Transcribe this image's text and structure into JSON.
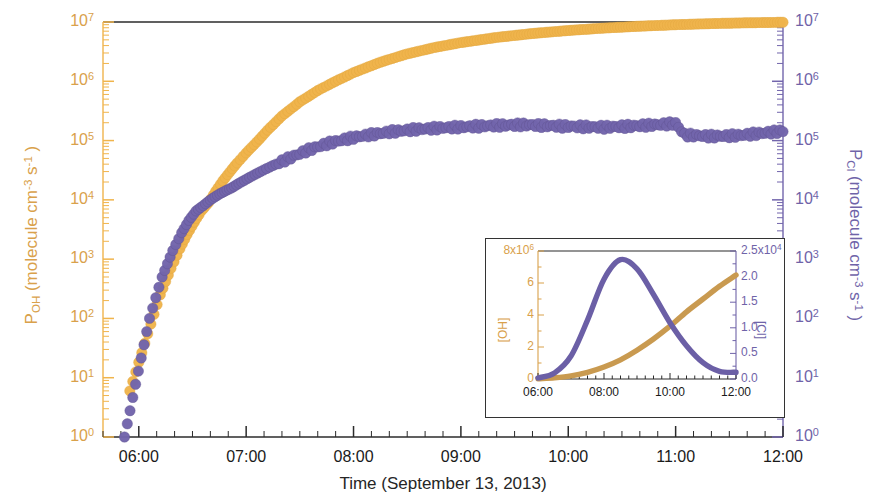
{
  "figure": {
    "xaxis": {
      "title": "Time (September 13, 2013)",
      "ticks": [
        "06:00",
        "07:00",
        "08:00",
        "09:00",
        "10:00",
        "11:00",
        "12:00"
      ]
    },
    "yaxis_left": {
      "title_main": "P",
      "title_sub": "OH",
      "title_rest": " (molecule cm",
      "title_sup1": "-3",
      "title_mid": " s",
      "title_sup2": "-1",
      "title_end": " )",
      "color": "#D9A14B",
      "ticks": [
        "10",
        "10",
        "10",
        "10",
        "10",
        "10",
        "10",
        "10"
      ],
      "exponents": [
        "7",
        "6",
        "5",
        "4",
        "3",
        "2",
        "1",
        "0"
      ]
    },
    "yaxis_right": {
      "title_main": "P",
      "title_sub": "Cl",
      "title_rest": " (molecule cm",
      "title_sup1": "-3",
      "title_mid": " s",
      "title_sup2": "-1",
      "title_end": " )",
      "color": "#6F63A8",
      "ticks": [
        "10",
        "10",
        "10",
        "10",
        "10",
        "10",
        "10",
        "10"
      ],
      "exponents": [
        "7",
        "6",
        "5",
        "4",
        "3",
        "2",
        "1",
        "0"
      ]
    },
    "inset": {
      "yaxis_left": {
        "label": "[OH]",
        "color": "#D9A14B",
        "top_tick": "8x10",
        "top_exp": "6",
        "ticks": [
          "6",
          "4",
          "2",
          "0"
        ]
      },
      "yaxis_right": {
        "label": "[Cl]",
        "color": "#6F63A8",
        "top_tick": "2.5x10",
        "top_exp": "4",
        "ticks": [
          "2.0",
          "1.5",
          "1.0",
          "0.5",
          "0.0"
        ]
      },
      "xticks": [
        "06:00",
        "08:00",
        "10:00",
        "12:00"
      ]
    }
  },
  "chart_data": {
    "type": "scatter",
    "title": "",
    "xlabel": "Time (September 13, 2013)",
    "ylabel": "P_OH (molecule cm^-3 s^-1)",
    "ylabel_right": "P_Cl (molecule cm^-3 s^-1)",
    "xlim": [
      "05:40",
      "12:00"
    ],
    "x_tick_labels": [
      "06:00",
      "07:00",
      "08:00",
      "09:00",
      "10:00",
      "11:00",
      "12:00"
    ],
    "yscale": "log",
    "ylim": [
      1,
      10000000
    ],
    "ylim_right": [
      1,
      10000000
    ],
    "grid": false,
    "legend": "none",
    "series": [
      {
        "name": "P_OH",
        "color": "#F0B44C",
        "marker": "circle",
        "axis": "left",
        "x": [
          "05:55",
          "06:05",
          "06:12",
          "06:18",
          "06:23",
          "06:27",
          "06:31",
          "06:35",
          "06:39",
          "06:43",
          "06:47",
          "06:51",
          "06:55",
          "07:00",
          "07:06",
          "07:12",
          "07:20",
          "07:30",
          "07:40",
          "07:50",
          "08:00",
          "08:15",
          "08:30",
          "08:45",
          "09:00",
          "09:20",
          "09:40",
          "10:00",
          "10:20",
          "10:40",
          "11:00",
          "11:20",
          "11:40",
          "12:00"
        ],
        "y": [
          6.0,
          55,
          250,
          700,
          1500,
          2600,
          4200,
          6500,
          9000,
          14000,
          21000,
          30000,
          42000,
          62000,
          95000,
          150000,
          260000,
          450000,
          700000,
          1000000,
          1400000,
          2100000,
          2900000,
          3700000,
          4500000,
          5500000,
          6400000,
          7200000,
          7900000,
          8500000,
          9000000,
          9400000,
          9700000,
          9900000
        ]
      },
      {
        "name": "P_Cl",
        "color": "#7265AC",
        "marker": "circle",
        "axis": "right",
        "x": [
          "05:52",
          "06:06",
          "06:13",
          "06:19",
          "06:24",
          "06:28",
          "06:32",
          "06:36",
          "06:40",
          "06:44",
          "06:48",
          "06:52",
          "06:56",
          "07:02",
          "07:08",
          "07:15",
          "07:25",
          "07:35",
          "07:45",
          "07:55",
          "08:05",
          "08:20",
          "08:35",
          "08:50",
          "09:05",
          "09:20",
          "09:35",
          "09:50",
          "10:05",
          "10:20",
          "10:35",
          "10:50",
          "11:00",
          "11:05",
          "11:20",
          "11:35",
          "11:50",
          "12:00"
        ],
        "y": [
          1.0,
          100,
          500,
          1400,
          2800,
          4500,
          6500,
          8000,
          10000,
          12000,
          14000,
          16000,
          19000,
          24000,
          30000,
          38000,
          52000,
          70000,
          88000,
          105000,
          120000,
          140000,
          155000,
          165000,
          172000,
          180000,
          185000,
          178000,
          172000,
          168000,
          175000,
          185000,
          195000,
          125000,
          118000,
          122000,
          135000,
          145000
        ]
      }
    ],
    "inset_chart": {
      "type": "line",
      "xlabel": "",
      "x_tick_labels": [
        "06:00",
        "08:00",
        "10:00",
        "12:00"
      ],
      "ylabel_left": "[OH]",
      "ylim_left": [
        0,
        8000000
      ],
      "y_tick_labels_left": [
        "8x10^6",
        "6",
        "4",
        "2",
        "0"
      ],
      "ylabel_right": "[Cl]",
      "ylim_right": [
        0,
        25000
      ],
      "y_tick_labels_right": [
        "2.5x10^4",
        "2.0",
        "1.5",
        "1.0",
        "0.5",
        "0.0"
      ],
      "series": [
        {
          "name": "[OH]",
          "color": "#C99A50",
          "axis": "left",
          "x": [
            "06:00",
            "06:30",
            "07:00",
            "07:30",
            "08:00",
            "08:30",
            "09:00",
            "09:30",
            "10:00",
            "10:30",
            "11:00",
            "11:30",
            "12:00"
          ],
          "y": [
            20000,
            80000,
            200000,
            420000,
            750000,
            1200000,
            1800000,
            2500000,
            3300000,
            4200000,
            5000000,
            5800000,
            6500000
          ]
        },
        {
          "name": "[Cl]",
          "color": "#6B5FA6",
          "axis": "right",
          "x": [
            "06:00",
            "06:30",
            "07:00",
            "07:30",
            "08:00",
            "08:30",
            "09:00",
            "09:30",
            "10:00",
            "10:30",
            "11:00",
            "11:30",
            "12:00"
          ],
          "y": [
            200,
            1200,
            4500,
            11500,
            19500,
            23300,
            21500,
            16500,
            11000,
            6500,
            3200,
            1500,
            1300
          ]
        }
      ]
    }
  }
}
